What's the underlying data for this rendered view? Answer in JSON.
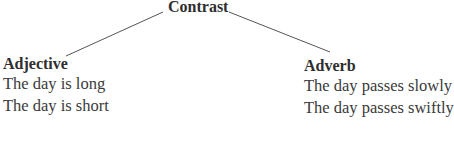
{
  "diagram": {
    "root": {
      "label": "Contrast"
    },
    "branches": [
      {
        "heading": "Adjective",
        "examples": [
          "The day is long",
          "The day is short"
        ]
      },
      {
        "heading": "Adverb",
        "examples": [
          "The day passes slowly",
          "The day passes swiftly"
        ]
      }
    ],
    "colors": {
      "text": "#2e2e2e",
      "line": "#555555",
      "background": "#ffffff"
    }
  }
}
